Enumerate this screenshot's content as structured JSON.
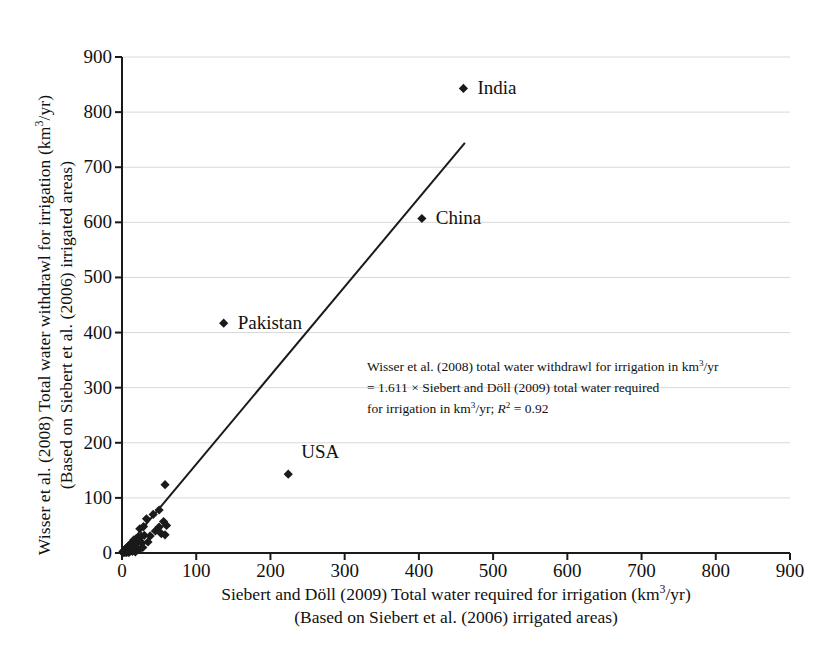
{
  "chart_data": {
    "type": "scatter",
    "title": "",
    "xlabel": "Siebert and Döll (2009) Total water required for irrigation (km3/yr)",
    "xlabel_line1": "Siebert and Döll (2009) Total water required for irrigation (km",
    "xlabel_line1_sup": "3",
    "xlabel_line1_tail": "/yr)",
    "xlabel_line2": "(Based on Siebert et al. (2006) irrigated areas)",
    "ylabel": "Wisser et al. (2008) Total water withdrawl for irrigation (km3/yr)",
    "ylabel_line1": "Wisser et al. (2008) Total water withdrawl for irrigation (km",
    "ylabel_line1_sup": "3",
    "ylabel_line1_tail": "/yr)",
    "ylabel_line2": "(Based on Siebert et al. (2006) irrigated areas)",
    "xlim": [
      0,
      900
    ],
    "ylim": [
      0,
      900
    ],
    "xticks": [
      0,
      100,
      200,
      300,
      400,
      500,
      600,
      700,
      800,
      900
    ],
    "yticks": [
      0,
      100,
      200,
      300,
      400,
      500,
      600,
      700,
      800,
      900
    ],
    "grid": "horizontal-light",
    "legend": "none",
    "marker": "diamond",
    "marker_color": "#1a1a1a",
    "line_color": "#1a1a1a",
    "trendline": {
      "slope": 1.611,
      "intercept": 0,
      "x_start": 0,
      "x_end": 462,
      "y_start": 0,
      "y_end": 744
    },
    "annotation": {
      "line1_a": "Wisser et al. (2008) total water withdrawl for irrigation in km",
      "line1_sup": "3",
      "line1_b": "/yr",
      "line2": "= 1.611 × Siebert and Döll (2009) total water required",
      "line3_a": "for irrigation in km",
      "line3_sup": "3",
      "line3_b": "/yr; ",
      "line3_r": "R",
      "line3_rsup": "2",
      "line3_c": " = 0.92"
    },
    "labeled_points": [
      {
        "name": "India",
        "x": 460,
        "y": 843,
        "label_dx": 14,
        "label_dy": 0
      },
      {
        "name": "China",
        "x": 404,
        "y": 607,
        "label_dx": 14,
        "label_dy": 0
      },
      {
        "name": "Pakistan",
        "x": 137,
        "y": 417,
        "label_dx": 14,
        "label_dy": 0
      },
      {
        "name": "USA",
        "x": 224,
        "y": 143,
        "label_dx": 13,
        "label_dy": -22
      }
    ],
    "points": [
      {
        "x": 460,
        "y": 843
      },
      {
        "x": 404,
        "y": 607
      },
      {
        "x": 137,
        "y": 417
      },
      {
        "x": 224,
        "y": 143
      },
      {
        "x": 58,
        "y": 124
      },
      {
        "x": 50,
        "y": 78
      },
      {
        "x": 42,
        "y": 70
      },
      {
        "x": 33,
        "y": 62
      },
      {
        "x": 56,
        "y": 57
      },
      {
        "x": 60,
        "y": 50
      },
      {
        "x": 50,
        "y": 47
      },
      {
        "x": 29,
        "y": 48
      },
      {
        "x": 24,
        "y": 44
      },
      {
        "x": 53,
        "y": 35
      },
      {
        "x": 58,
        "y": 33
      },
      {
        "x": 30,
        "y": 32
      },
      {
        "x": 26,
        "y": 30
      },
      {
        "x": 22,
        "y": 28
      },
      {
        "x": 19,
        "y": 26
      },
      {
        "x": 16,
        "y": 24
      },
      {
        "x": 21,
        "y": 21
      },
      {
        "x": 14,
        "y": 20
      },
      {
        "x": 27,
        "y": 18
      },
      {
        "x": 12,
        "y": 17
      },
      {
        "x": 18,
        "y": 15
      },
      {
        "x": 10,
        "y": 14
      },
      {
        "x": 15,
        "y": 12
      },
      {
        "x": 8,
        "y": 12
      },
      {
        "x": 13,
        "y": 10
      },
      {
        "x": 20,
        "y": 9
      },
      {
        "x": 7,
        "y": 9
      },
      {
        "x": 11,
        "y": 8
      },
      {
        "x": 5,
        "y": 8
      },
      {
        "x": 16,
        "y": 7
      },
      {
        "x": 9,
        "y": 6
      },
      {
        "x": 4,
        "y": 6
      },
      {
        "x": 12,
        "y": 5
      },
      {
        "x": 6,
        "y": 5
      },
      {
        "x": 3,
        "y": 4
      },
      {
        "x": 8,
        "y": 4
      },
      {
        "x": 14,
        "y": 3
      },
      {
        "x": 5,
        "y": 3
      },
      {
        "x": 2,
        "y": 3
      },
      {
        "x": 10,
        "y": 2
      },
      {
        "x": 7,
        "y": 2
      },
      {
        "x": 3,
        "y": 2
      },
      {
        "x": 1,
        "y": 2
      },
      {
        "x": 6,
        "y": 1
      },
      {
        "x": 4,
        "y": 1
      },
      {
        "x": 2,
        "y": 1
      },
      {
        "x": 1,
        "y": 1
      },
      {
        "x": 9,
        "y": 1
      },
      {
        "x": 18,
        "y": 2
      },
      {
        "x": 23,
        "y": 6
      },
      {
        "x": 28,
        "y": 10
      },
      {
        "x": 35,
        "y": 20
      },
      {
        "x": 38,
        "y": 31
      },
      {
        "x": 45,
        "y": 40
      }
    ]
  }
}
